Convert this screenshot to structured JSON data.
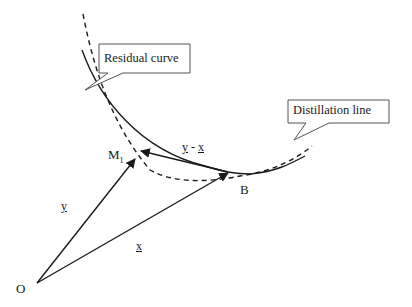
{
  "diagram": {
    "callouts": {
      "residual": {
        "label": "Residual curve"
      },
      "distillation": {
        "label": "Distillation line"
      }
    },
    "points": {
      "origin": {
        "label": "O"
      },
      "m1": {
        "label": "M",
        "subscript": "1"
      },
      "b": {
        "label": "B"
      }
    },
    "vectors": {
      "y": {
        "label": "y"
      },
      "x": {
        "label": "x"
      },
      "diff": {
        "label_y": "y",
        "label_sep": " - ",
        "label_x": "x"
      }
    },
    "colors": {
      "line": "#1a1a1a",
      "callout_border": "#555555",
      "background": "#ffffff"
    }
  }
}
